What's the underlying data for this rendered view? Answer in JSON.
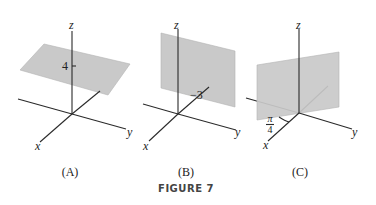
{
  "figure": {
    "caption": "FIGURE 7",
    "colors": {
      "plane_fill": "#c9c9c9",
      "axis": "#2a2a2a",
      "background": "#ffffff"
    },
    "panels": [
      {
        "id": "A",
        "label": "(A)",
        "description": "Horizontal plane z = 4",
        "axis_labels": {
          "x": "x",
          "y": "y",
          "z": "z"
        },
        "annotation": "4"
      },
      {
        "id": "B",
        "label": "(B)",
        "description": "Vertical plane y = -3",
        "axis_labels": {
          "x": "x",
          "y": "y",
          "z": "z"
        },
        "annotation": "−3"
      },
      {
        "id": "C",
        "label": "(C)",
        "description": "Vertical plane at angle pi/4 from x-axis",
        "axis_labels": {
          "x": "x",
          "y": "y",
          "z": "z"
        },
        "annotation": {
          "numerator": "π",
          "denominator": "4"
        }
      }
    ]
  }
}
